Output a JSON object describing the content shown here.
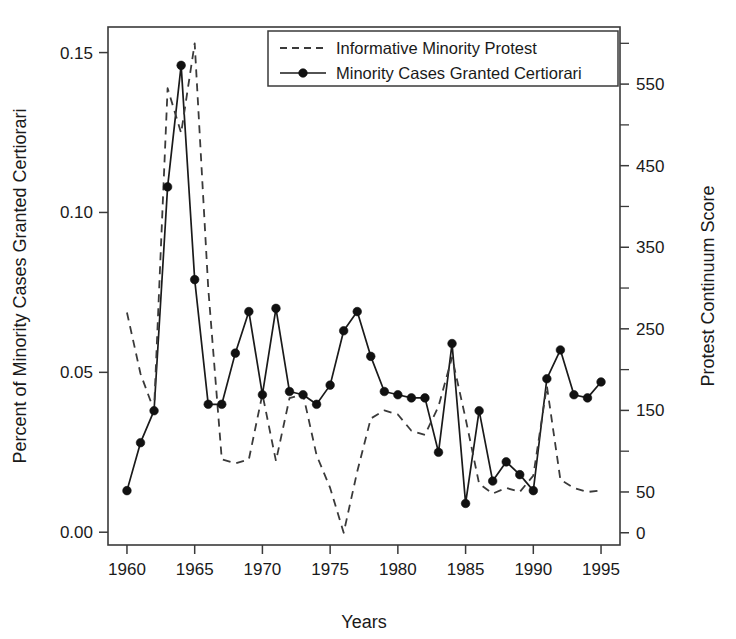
{
  "chart_data": {
    "type": "line",
    "title": "",
    "xlabel": "Years",
    "ylabel": "Percent of Minority Cases Granted Certiorari",
    "y2label": "Protest Continuum Score",
    "xlim": [
      1958.6,
      1996.4
    ],
    "ylim": [
      -0.004,
      0.158
    ],
    "y2lim": [
      -15,
      620
    ],
    "grid": false,
    "legend_position": "top-center",
    "xticks": [
      1960,
      1965,
      1970,
      1975,
      1980,
      1985,
      1990,
      1995
    ],
    "xtick_labels": [
      "1960",
      "1965",
      "1970",
      "1975",
      "1980",
      "1985",
      "1990",
      "1995"
    ],
    "yticks": [
      0.0,
      0.05,
      0.1,
      0.15
    ],
    "ytick_labels": [
      "0.00",
      "0.05",
      "0.10",
      "0.15"
    ],
    "y2ticks": [
      0,
      50,
      100,
      150,
      200,
      250,
      300,
      350,
      400,
      450,
      500,
      550,
      600
    ],
    "y2tick_labels": [
      "0",
      "50",
      "",
      "150",
      "",
      "250",
      "",
      "350",
      "",
      "450",
      "",
      "550",
      ""
    ],
    "x": [
      1960,
      1961,
      1962,
      1963,
      1964,
      1965,
      1966,
      1967,
      1968,
      1969,
      1970,
      1971,
      1972,
      1973,
      1974,
      1975,
      1976,
      1977,
      1978,
      1979,
      1980,
      1981,
      1982,
      1983,
      1984,
      1985,
      1986,
      1987,
      1988,
      1989,
      1990,
      1991,
      1992,
      1993,
      1994,
      1995
    ],
    "series": [
      {
        "name": "Minority Cases Granted Certiorari",
        "axis": "left",
        "style": "solid",
        "marker": "filled-circle",
        "color": "#1a1a1a",
        "values": [
          0.013,
          0.028,
          0.038,
          0.108,
          0.146,
          0.079,
          0.04,
          0.04,
          0.056,
          0.069,
          0.043,
          0.07,
          0.044,
          0.043,
          0.04,
          0.046,
          0.063,
          0.069,
          0.055,
          0.044,
          0.043,
          0.042,
          0.042,
          0.025,
          0.059,
          0.009,
          0.038,
          0.016,
          0.022,
          0.018,
          0.013,
          0.048,
          0.057,
          0.043,
          0.042,
          0.047
        ]
      },
      {
        "name": "Informative Minority Protest",
        "axis": "right",
        "style": "dashed",
        "marker": "none",
        "color": "#3a3a3a",
        "values": [
          270,
          195,
          150,
          545,
          490,
          600,
          300,
          90,
          85,
          90,
          170,
          88,
          165,
          170,
          95,
          55,
          0,
          75,
          140,
          150,
          145,
          125,
          120,
          155,
          215,
          140,
          60,
          48,
          55,
          50,
          70,
          180,
          65,
          55,
          50,
          52
        ]
      }
    ]
  },
  "legend": {
    "entries": [
      {
        "label": "Informative Minority Protest",
        "style": "dashed"
      },
      {
        "label": "Minority Cases Granted Certiorari",
        "style": "solid-marker"
      }
    ]
  },
  "axes": {
    "left_title": "Percent of Minority Cases Granted Certiorari",
    "right_title": "Protest Continuum Score",
    "bottom_title": "Years"
  }
}
